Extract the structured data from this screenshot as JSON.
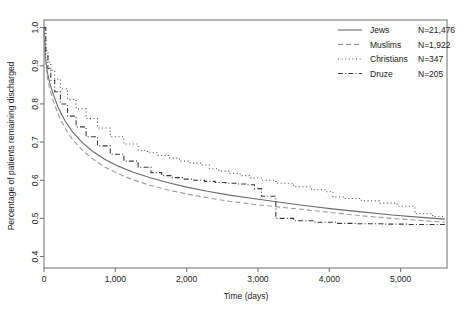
{
  "chart_data": {
    "type": "line",
    "title": "",
    "xlabel": "Time (days)",
    "ylabel": "Percentage of patients remaining discharged",
    "xlim": [
      0,
      5650
    ],
    "ylim": [
      0.37,
      1.02
    ],
    "xticks": [
      0,
      1000,
      2000,
      3000,
      4000,
      5000
    ],
    "xticklabels": [
      "0",
      "1,000",
      "2,000",
      "3,000",
      "4,000",
      "5,000"
    ],
    "yticks": [
      0.4,
      0.5,
      0.6,
      0.7,
      0.8,
      0.9,
      1.0
    ],
    "yticklabels": [
      "0.4",
      "0.5",
      "0.6",
      "0.7",
      "0.8",
      "0.9",
      "1.0"
    ],
    "grid": false,
    "legend_position": "top-right",
    "series": [
      {
        "name": "Jews",
        "count_label": "N=21,476",
        "linestyle": "solid",
        "color": "#6b6b6b",
        "x": [
          0,
          20,
          45,
          80,
          130,
          200,
          290,
          400,
          530,
          680,
          850,
          1040,
          1250,
          1480,
          1730,
          2000,
          2290,
          2600,
          2930,
          3280,
          3650,
          4040,
          4450,
          4880,
          5330,
          5620
        ],
        "y": [
          1.0,
          0.925,
          0.885,
          0.855,
          0.825,
          0.79,
          0.757,
          0.727,
          0.7,
          0.676,
          0.655,
          0.637,
          0.621,
          0.607,
          0.594,
          0.582,
          0.571,
          0.561,
          0.552,
          0.543,
          0.534,
          0.525,
          0.517,
          0.509,
          0.502,
          0.498
        ]
      },
      {
        "name": "Muslims",
        "count_label": "N=1,922",
        "linestyle": "dashed",
        "color": "#9a9a9a",
        "x": [
          0,
          20,
          45,
          80,
          130,
          200,
          290,
          400,
          530,
          680,
          850,
          1040,
          1250,
          1480,
          1730,
          2000,
          2290,
          2600,
          2930,
          3280,
          3650,
          4040,
          4450,
          4880,
          5330,
          5620
        ],
        "y": [
          1.0,
          0.915,
          0.872,
          0.84,
          0.808,
          0.772,
          0.738,
          0.707,
          0.68,
          0.656,
          0.635,
          0.617,
          0.601,
          0.587,
          0.575,
          0.564,
          0.554,
          0.545,
          0.537,
          0.53,
          0.523,
          0.515,
          0.507,
          0.5,
          0.494,
          0.49
        ]
      },
      {
        "name": "Christians",
        "count_label": "N=347",
        "linestyle": "dotted",
        "color": "#4a4a4a",
        "x": [
          0,
          25,
          55,
          95,
          150,
          230,
          330,
          450,
          590,
          750,
          930,
          1120,
          1320,
          1450,
          1600,
          1750,
          1900,
          2050,
          2200,
          2320,
          2450,
          2600,
          2750,
          2900,
          3050,
          3250,
          3500,
          3750,
          3950,
          4050,
          4200,
          4450,
          4700,
          4950,
          5200,
          5450,
          5620
        ],
        "y": [
          1.0,
          0.94,
          0.91,
          0.888,
          0.865,
          0.84,
          0.812,
          0.787,
          0.762,
          0.737,
          0.714,
          0.695,
          0.678,
          0.672,
          0.665,
          0.658,
          0.65,
          0.645,
          0.64,
          0.63,
          0.624,
          0.618,
          0.612,
          0.606,
          0.6,
          0.592,
          0.583,
          0.575,
          0.57,
          0.556,
          0.552,
          0.546,
          0.54,
          0.532,
          0.512,
          0.505,
          0.503
        ]
      },
      {
        "name": "Druze",
        "count_label": "N=205",
        "linestyle": "dashdot",
        "color": "#3a3a3a",
        "x": [
          0,
          25,
          55,
          95,
          150,
          230,
          330,
          450,
          590,
          750,
          930,
          1120,
          1320,
          1500,
          1650,
          1800,
          1950,
          2100,
          2250,
          2400,
          2550,
          2700,
          2850,
          2950,
          3050,
          3250,
          3500,
          3800,
          4100,
          4400,
          4750,
          5100,
          5400,
          5620
        ],
        "y": [
          1.0,
          0.93,
          0.893,
          0.862,
          0.832,
          0.8,
          0.768,
          0.74,
          0.714,
          0.69,
          0.668,
          0.65,
          0.634,
          0.62,
          0.612,
          0.607,
          0.603,
          0.6,
          0.597,
          0.594,
          0.592,
          0.59,
          0.588,
          0.578,
          0.558,
          0.5,
          0.494,
          0.49,
          0.487,
          0.486,
          0.485,
          0.484,
          0.484,
          0.484
        ]
      }
    ]
  }
}
